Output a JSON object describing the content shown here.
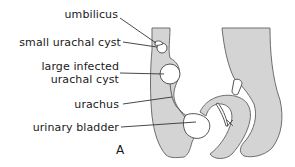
{
  "figure": {
    "panel_letter": "A",
    "labels": [
      {
        "id": "umbilicus",
        "text": "umbilicus"
      },
      {
        "id": "small-urachal-cyst",
        "text": "small urachal cyst"
      },
      {
        "id": "large-infected-urachal-cyst",
        "text": "large infected urachal cyst",
        "lines": [
          "large infected",
          "urachal cyst"
        ]
      },
      {
        "id": "urachus",
        "text": "urachus"
      },
      {
        "id": "urinary-bladder",
        "text": "urinary bladder"
      }
    ]
  },
  "colors": {
    "tissue_fill": "#d4d4d4",
    "outline": "#6e6e6e",
    "background": "#ffffff",
    "text": "#1a1a1a"
  }
}
